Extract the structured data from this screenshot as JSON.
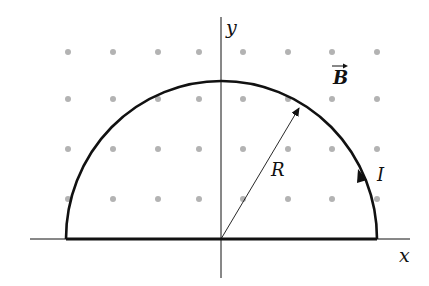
{
  "diagram": {
    "labels": {
      "x_axis": "x",
      "y_axis": "y",
      "field": "B",
      "radius": "R",
      "current": "I"
    },
    "colors": {
      "stroke": "#111111",
      "dots": "#b3b3b3",
      "background": "#ffffff"
    },
    "field_direction": "out of page (dots)",
    "dot_grid": {
      "columns_x": [
        68,
        113,
        158,
        199,
        243,
        288,
        332,
        377
      ],
      "rows_y": [
        52,
        99,
        149,
        199
      ]
    }
  }
}
